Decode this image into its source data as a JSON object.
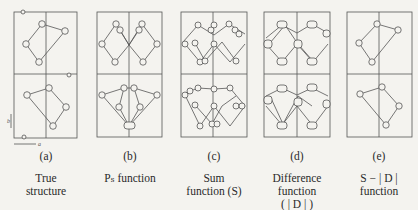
{
  "figure": {
    "panels": [
      {
        "id": "a",
        "letter": "(a)",
        "caption_lines": [
          "True",
          "structure"
        ]
      },
      {
        "id": "b",
        "letter": "(b)",
        "caption_lines": [
          "Pₛ function"
        ]
      },
      {
        "id": "c",
        "letter": "(c)",
        "caption_lines": [
          "Sum",
          "function (S)"
        ]
      },
      {
        "id": "d",
        "letter": "(d)",
        "caption_lines": [
          "Difference",
          "function",
          "( | D | )"
        ]
      },
      {
        "id": "e",
        "letter": "(e)",
        "caption_lines": [
          "S − | D |",
          "function"
        ]
      }
    ],
    "axes": {
      "a_label": "a",
      "b_label": "b"
    },
    "colors": {
      "line": "#555555",
      "background": "#f4f3ef"
    }
  }
}
